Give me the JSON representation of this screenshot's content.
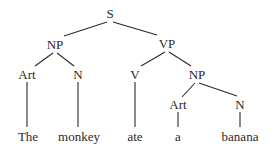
{
  "tree": {
    "nodes": {
      "s": {
        "label": "S",
        "x": 110,
        "y": 18
      },
      "np1": {
        "label": "NP",
        "x": 55,
        "y": 49
      },
      "vp": {
        "label": "VP",
        "x": 167,
        "y": 48
      },
      "art1": {
        "label": "Art",
        "x": 27,
        "y": 79
      },
      "n1": {
        "label": "N",
        "x": 78,
        "y": 79
      },
      "v": {
        "label": "V",
        "x": 135,
        "y": 79
      },
      "np2": {
        "label": "NP",
        "x": 197,
        "y": 79
      },
      "art2": {
        "label": "Art",
        "x": 178,
        "y": 109
      },
      "n2": {
        "label": "N",
        "x": 240,
        "y": 109
      }
    },
    "words": {
      "w1": {
        "label": "The",
        "x": 28,
        "y": 141
      },
      "w2": {
        "label": "monkey",
        "x": 79,
        "y": 141
      },
      "w3": {
        "label": "ate",
        "x": 135,
        "y": 141
      },
      "w4": {
        "label": "a",
        "x": 178,
        "y": 141
      },
      "w5": {
        "label": "banana",
        "x": 240,
        "y": 141
      }
    }
  }
}
